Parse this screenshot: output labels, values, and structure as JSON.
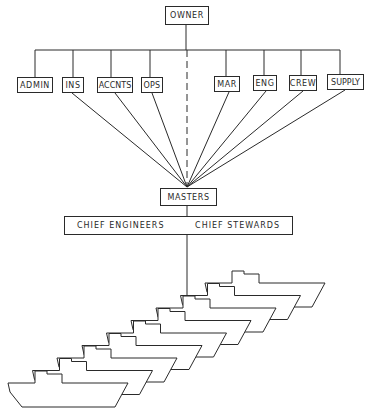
{
  "diagram": {
    "type": "organization-chart",
    "root": {
      "label": "OWNER"
    },
    "departments": [
      {
        "label": "ADMIN",
        "connects_to_masters": false
      },
      {
        "label": "INS",
        "connects_to_masters": true
      },
      {
        "label": "ACCNTS",
        "connects_to_masters": true
      },
      {
        "label": "OPS",
        "connects_to_masters": true
      },
      {
        "label": "MAR",
        "connects_to_masters": true
      },
      {
        "label": "ENG",
        "connects_to_masters": true
      },
      {
        "label": "CREW",
        "connects_to_masters": true
      },
      {
        "label": "SUPPLY",
        "connects_to_masters": true
      }
    ],
    "direct_link": {
      "from": "OWNER",
      "to": "MASTERS",
      "style": "dashed"
    },
    "masters": {
      "label": "MASTERS"
    },
    "ship_officers": {
      "left_label": "CHIEF ENGINEERS",
      "right_label": "CHIEF STEWARDS"
    },
    "fleet": {
      "ship_count": 9,
      "icon": "ship-icon"
    },
    "colors": {
      "line": "#2a2a2a",
      "background": "#ffffff"
    }
  }
}
